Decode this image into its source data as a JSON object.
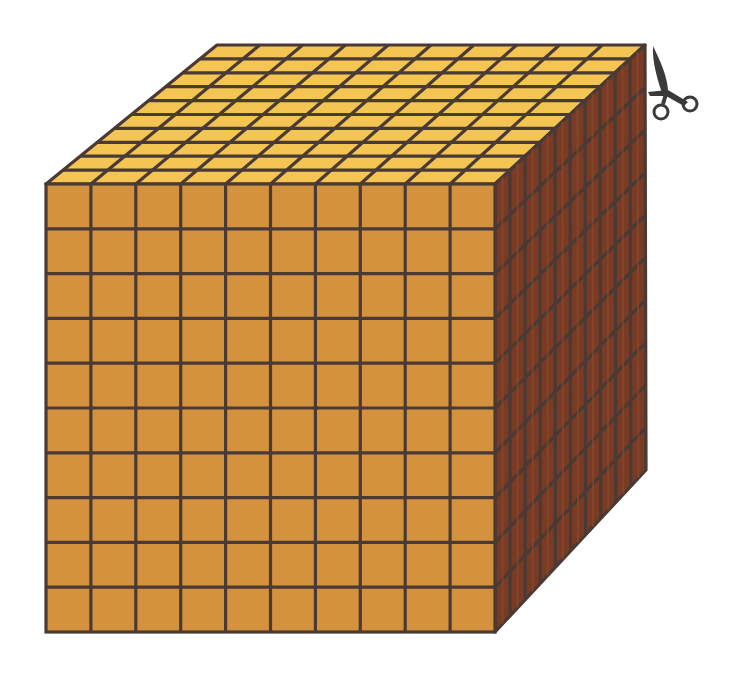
{
  "figure": {
    "title": "Base-ten thousand cube (10 x 10 x 10)",
    "grid_size": 10,
    "colors": {
      "front_face": "#d4923f",
      "top_face": "#f4c552",
      "right_face": "#7a3b24",
      "grid_line": "#4a3a35",
      "scissors": "#3a3a3a"
    },
    "corners": {
      "front_top_left": [
        46,
        184
      ],
      "front_top_right": [
        495,
        184
      ],
      "front_bottom_left": [
        46,
        632
      ],
      "front_bottom_right": [
        495,
        632
      ],
      "back_top_left": [
        217,
        45
      ],
      "back_top_right": [
        645,
        45
      ],
      "back_bottom_right": [
        646,
        470
      ]
    },
    "icons": {
      "scissors": "scissors-icon"
    }
  }
}
